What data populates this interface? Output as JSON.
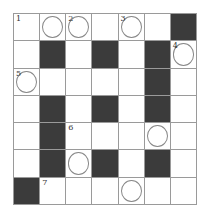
{
  "puzzle": {
    "rows": 7,
    "cols": 7,
    "colors": {
      "block": "#3b3b3b",
      "line": "#9a9a9a",
      "circle": "#888888"
    },
    "cells": [
      [
        {
          "t": "w",
          "n": "1"
        },
        {
          "t": "c"
        },
        {
          "t": "c",
          "n": "2"
        },
        {
          "t": "w"
        },
        {
          "t": "c",
          "n": "3"
        },
        {
          "t": "w"
        },
        {
          "t": "b"
        }
      ],
      [
        {
          "t": "w"
        },
        {
          "t": "b"
        },
        {
          "t": "w"
        },
        {
          "t": "b"
        },
        {
          "t": "w"
        },
        {
          "t": "b"
        },
        {
          "t": "c",
          "n": "4"
        }
      ],
      [
        {
          "t": "c",
          "n": "5"
        },
        {
          "t": "w"
        },
        {
          "t": "w"
        },
        {
          "t": "w"
        },
        {
          "t": "w"
        },
        {
          "t": "b"
        },
        {
          "t": "w"
        }
      ],
      [
        {
          "t": "w"
        },
        {
          "t": "b"
        },
        {
          "t": "w"
        },
        {
          "t": "b"
        },
        {
          "t": "w"
        },
        {
          "t": "b"
        },
        {
          "t": "w"
        }
      ],
      [
        {
          "t": "w"
        },
        {
          "t": "b"
        },
        {
          "t": "w",
          "n": "6"
        },
        {
          "t": "w"
        },
        {
          "t": "w"
        },
        {
          "t": "c"
        },
        {
          "t": "w"
        }
      ],
      [
        {
          "t": "w"
        },
        {
          "t": "b"
        },
        {
          "t": "c"
        },
        {
          "t": "b"
        },
        {
          "t": "w"
        },
        {
          "t": "b"
        },
        {
          "t": "w"
        }
      ],
      [
        {
          "t": "b"
        },
        {
          "t": "w",
          "n": "7"
        },
        {
          "t": "w"
        },
        {
          "t": "w"
        },
        {
          "t": "c"
        },
        {
          "t": "w"
        },
        {
          "t": "w"
        }
      ]
    ]
  }
}
